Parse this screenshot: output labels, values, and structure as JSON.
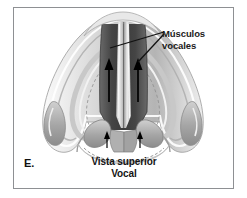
{
  "figure": {
    "panel_letter": "E.",
    "caption_line1": "Vista superior",
    "caption_line2": "Vocal",
    "callout_line1": "Músculos",
    "callout_line2": "vocales",
    "colors": {
      "frame_border": "#8e9093",
      "background": "#ffffff",
      "cartilage_light": "#e4e4e4",
      "cartilage_mid": "#c3c3c3",
      "cartilage_shadow": "#9a9a9a",
      "glottis_dark": "#4d4d4d",
      "glottis_darker": "#3a3a3a",
      "vocal_fold_pale": "#d8d8d8",
      "arrow_black": "#000000",
      "text": "#141414"
    },
    "annotations": {
      "arrow_count_main": 2,
      "arrow_count_small": 2,
      "leader_line_count": 2,
      "arrow_direction": "up"
    }
  }
}
